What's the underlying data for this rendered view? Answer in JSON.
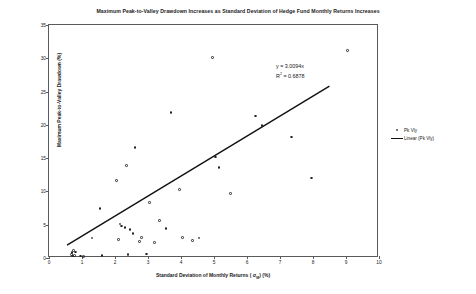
{
  "chart_data": {
    "type": "scatter",
    "title": "Maximum Peak-to-Valley Drawdown Increases as Standard Deviation of Hedge Fund Monthly Returns Increases",
    "xlabel": "Standard Deviation of Monthly Returns ( σM) (%)",
    "ylabel": "Maximum Peak-to-Valley Drawdown (%)",
    "xlim": [
      0,
      10
    ],
    "ylim": [
      0,
      35
    ],
    "xticks": [
      0,
      1,
      2,
      3,
      4,
      5,
      6,
      7,
      8,
      9,
      10
    ],
    "yticks": [
      0,
      5,
      10,
      15,
      20,
      25,
      30,
      35
    ],
    "grid": false,
    "legend_position": "right",
    "series": [
      {
        "name": "Pk Vly",
        "type": "scatter",
        "marker": "open-circle",
        "color": "#222222",
        "points": [
          [
            0.68,
            0.5
          ],
          [
            0.7,
            0.8
          ],
          [
            0.72,
            0.3
          ],
          [
            0.75,
            1.1
          ],
          [
            0.78,
            0.4
          ],
          [
            0.8,
            0.9
          ],
          [
            0.95,
            0.3
          ],
          [
            1.05,
            0.2
          ],
          [
            1.3,
            3.0
          ],
          [
            1.55,
            7.4
          ],
          [
            1.6,
            0.4
          ],
          [
            2.05,
            11.6
          ],
          [
            2.1,
            2.8
          ],
          [
            2.15,
            5.1
          ],
          [
            2.2,
            4.8
          ],
          [
            2.3,
            4.6
          ],
          [
            2.35,
            13.9
          ],
          [
            2.4,
            0.5
          ],
          [
            2.45,
            4.3
          ],
          [
            2.55,
            3.7
          ],
          [
            2.6,
            16.6
          ],
          [
            2.75,
            2.5
          ],
          [
            2.8,
            3.1
          ],
          [
            2.95,
            0.6
          ],
          [
            3.05,
            8.3
          ],
          [
            3.2,
            2.3
          ],
          [
            3.35,
            5.6
          ],
          [
            3.55,
            4.4
          ],
          [
            3.7,
            21.9
          ],
          [
            3.95,
            10.3
          ],
          [
            4.05,
            3.1
          ],
          [
            4.35,
            2.6
          ],
          [
            4.55,
            3.0
          ],
          [
            4.95,
            30.1
          ],
          [
            5.05,
            15.2
          ],
          [
            5.15,
            13.6
          ],
          [
            5.5,
            9.7
          ],
          [
            6.25,
            21.3
          ],
          [
            6.45,
            19.9
          ],
          [
            7.35,
            18.2
          ],
          [
            7.95,
            12.0
          ],
          [
            9.05,
            31.2
          ]
        ]
      },
      {
        "name": "Linear (Pk Vly)",
        "type": "line",
        "color": "#111111",
        "equation": "y = 3.0094x",
        "r_squared": "R² = 0.6878",
        "slope": 3.0094,
        "intercept": 0,
        "x_range": [
          0.55,
          8.55
        ]
      }
    ],
    "annotations": [
      {
        "text": "y = 3.0094x"
      },
      {
        "text": "R",
        "sup": "2",
        "rest": " = 0.6878"
      }
    ]
  },
  "legend": {
    "items": [
      {
        "label": "Pk Vly",
        "marker": "open-circle"
      },
      {
        "label": "Linear (Pk Vly)",
        "marker": "line"
      }
    ]
  },
  "equation": {
    "line1": "y = 3.0094x",
    "line2_prefix": "R",
    "line2_sup": "2",
    "line2_rest": " = 0.6878"
  },
  "axis": {
    "x_label_prefix": "Standard Deviation of Monthly Returns ( σ",
    "x_label_sub": "M",
    "x_label_suffix": ") (%)",
    "y_label": "Maximum Peak-to-Valley Drawdown (%)"
  }
}
